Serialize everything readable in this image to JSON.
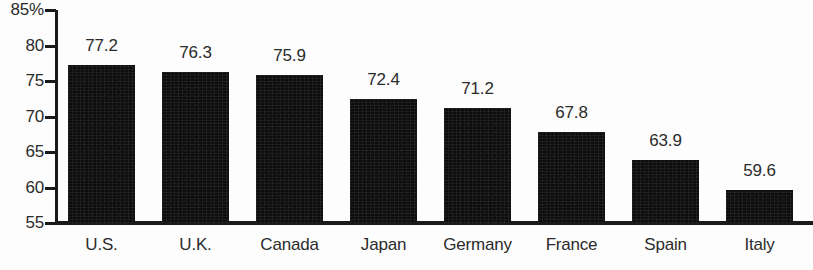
{
  "chart_data": {
    "type": "bar",
    "title": "",
    "subtitle": "",
    "xlabel": "",
    "ylabel": "",
    "ylim": [
      55,
      85
    ],
    "grid": false,
    "legend": null,
    "y_axis_unit": "%",
    "y_ticks": [
      {
        "value": 85,
        "label": "85%"
      },
      {
        "value": 80,
        "label": "80"
      },
      {
        "value": 75,
        "label": "75"
      },
      {
        "value": 70,
        "label": "70"
      },
      {
        "value": 65,
        "label": "65"
      },
      {
        "value": 60,
        "label": "60"
      },
      {
        "value": 55,
        "label": "55"
      }
    ],
    "categories": [
      "U.S.",
      "U.K.",
      "Canada",
      "Japan",
      "Germany",
      "France",
      "Spain",
      "Italy"
    ],
    "values": [
      77.2,
      76.3,
      75.9,
      72.4,
      71.2,
      67.8,
      63.9,
      59.6
    ],
    "value_labels": [
      "77.2",
      "76.3",
      "75.9",
      "72.4",
      "71.2",
      "67.8",
      "63.9",
      "59.6"
    ],
    "bar_color": "#0d0d0d",
    "text_color": "#2b2b2b",
    "axis_color": "#1a1a1a",
    "background_color": "#fdfdfd",
    "bars": [
      {
        "category": "U.S.",
        "value": 77.2,
        "label": "77.2"
      },
      {
        "category": "U.K.",
        "value": 76.3,
        "label": "76.3"
      },
      {
        "category": "Canada",
        "value": 75.9,
        "label": "75.9"
      },
      {
        "category": "Japan",
        "value": 72.4,
        "label": "72.4"
      },
      {
        "category": "Germany",
        "value": 71.2,
        "label": "71.2"
      },
      {
        "category": "France",
        "value": 67.8,
        "label": "67.8"
      },
      {
        "category": "Spain",
        "value": 63.9,
        "label": "63.9"
      },
      {
        "category": "Italy",
        "value": 59.6,
        "label": "59.6"
      }
    ]
  }
}
